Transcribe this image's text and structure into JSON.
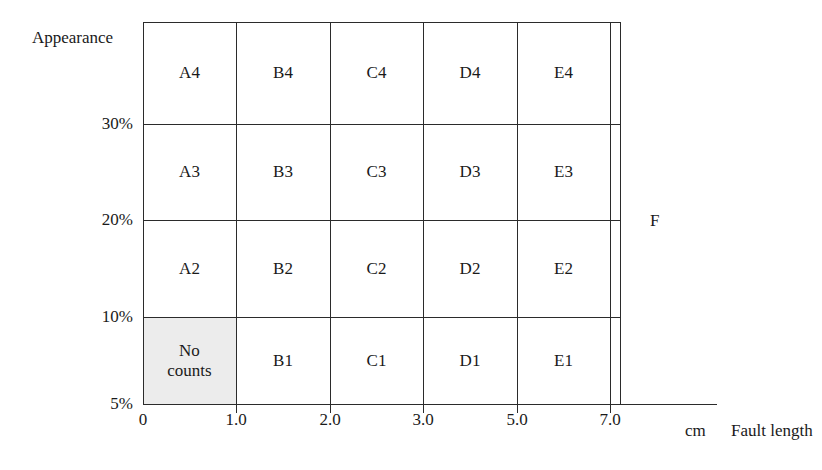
{
  "chart_data": {
    "type": "heatmap",
    "title": "",
    "xlabel": "Fault length",
    "xunit": "cm",
    "ylabel": "Appearance",
    "x_tick_labels": [
      "0",
      "1.0",
      "2.0",
      "3.0",
      "5.0",
      "7.0"
    ],
    "y_tick_labels": [
      "30%",
      "20%",
      "10%",
      "5%"
    ],
    "xlim": [
      0,
      7.0
    ],
    "ylim": [
      5,
      35
    ],
    "grid": true,
    "legend": "none",
    "columns": [
      "A",
      "B",
      "C",
      "D",
      "E"
    ],
    "rows": [
      "4",
      "3",
      "2",
      "1"
    ],
    "cells": [
      [
        "A4",
        "B4",
        "C4",
        "D4",
        "E4"
      ],
      [
        "A3",
        "B3",
        "C3",
        "D3",
        "E3"
      ],
      [
        "A2",
        "B2",
        "C2",
        "D2",
        "E2"
      ],
      [
        "No counts",
        "B1",
        "C1",
        "D1",
        "E1"
      ]
    ],
    "shaded_cells": [
      "A1"
    ],
    "no_counts_label": "No counts",
    "annotations": [
      {
        "text": "F",
        "x_px": 650,
        "y_px": 211
      }
    ],
    "colors": {
      "background": "#ffffff",
      "line": "#2b2b2b",
      "text": "#1a1a1a",
      "shaded_cell": "#ececec"
    }
  },
  "axes": {
    "y_title": "Appearance",
    "x_title": "Fault length",
    "x_unit": "cm"
  },
  "y_ticks": [
    {
      "label": "30%",
      "top_px": 124
    },
    {
      "label": "20%",
      "top_px": 220
    },
    {
      "label": "10%",
      "top_px": 317
    },
    {
      "label": "5%",
      "top_px": 404
    }
  ],
  "x_ticks": [
    {
      "label": "0",
      "left_px": 143
    },
    {
      "label": "1.0",
      "left_px": 236
    },
    {
      "label": "2.0",
      "left_px": 330
    },
    {
      "label": "3.0",
      "left_px": 423
    },
    {
      "label": "5.0",
      "left_px": 517
    },
    {
      "label": "7.0",
      "left_px": 610
    }
  ],
  "grid_cells": [
    {
      "label": "A4",
      "col": 0,
      "row": 0,
      "shaded": false
    },
    {
      "label": "B4",
      "col": 1,
      "row": 0,
      "shaded": false
    },
    {
      "label": "C4",
      "col": 2,
      "row": 0,
      "shaded": false
    },
    {
      "label": "D4",
      "col": 3,
      "row": 0,
      "shaded": false
    },
    {
      "label": "E4",
      "col": 4,
      "row": 0,
      "shaded": false
    },
    {
      "label": "A3",
      "col": 0,
      "row": 1,
      "shaded": false
    },
    {
      "label": "B3",
      "col": 1,
      "row": 1,
      "shaded": false
    },
    {
      "label": "C3",
      "col": 2,
      "row": 1,
      "shaded": false
    },
    {
      "label": "D3",
      "col": 3,
      "row": 1,
      "shaded": false
    },
    {
      "label": "E3",
      "col": 4,
      "row": 1,
      "shaded": false
    },
    {
      "label": "A2",
      "col": 0,
      "row": 2,
      "shaded": false
    },
    {
      "label": "B2",
      "col": 1,
      "row": 2,
      "shaded": false
    },
    {
      "label": "C2",
      "col": 2,
      "row": 2,
      "shaded": false
    },
    {
      "label": "D2",
      "col": 3,
      "row": 2,
      "shaded": false
    },
    {
      "label": "E2",
      "col": 4,
      "row": 2,
      "shaded": false
    },
    {
      "label": "No\ncounts",
      "col": 0,
      "row": 3,
      "shaded": true
    },
    {
      "label": "B1",
      "col": 1,
      "row": 3,
      "shaded": false
    },
    {
      "label": "C1",
      "col": 2,
      "row": 3,
      "shaded": false
    },
    {
      "label": "D1",
      "col": 3,
      "row": 3,
      "shaded": false
    },
    {
      "label": "E1",
      "col": 4,
      "row": 3,
      "shaded": false
    }
  ],
  "region_label": "F"
}
